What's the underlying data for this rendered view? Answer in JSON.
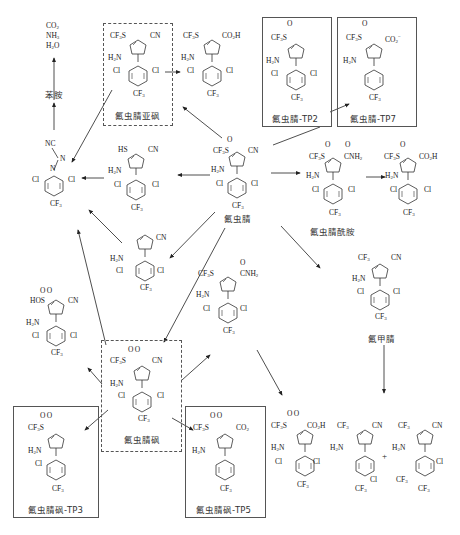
{
  "diagram": {
    "type": "degradation-pathway",
    "end_products": {
      "lines": [
        "CO₂",
        "NH₃",
        "H₂O"
      ],
      "aniline_label": "苯胺"
    },
    "compounds": [
      {
        "id": "fipronil",
        "label": "氟虫腈",
        "substituents": {
          "s4": "CF₃S(=O)",
          "s3": "CN",
          "s5": "H₂N",
          "aryl": "2,6-Cl-4-CF₃-phenyl"
        },
        "frame": "none"
      },
      {
        "id": "fipronil-sulfide",
        "label": "氟虫腈亚砜",
        "substituents": {
          "s4": "CF₃S",
          "s3": "CN",
          "s5": "H₂N",
          "aryl": "2,6-Cl-4-CF₃-phenyl"
        },
        "frame": "dashed"
      },
      {
        "id": "sulfide-acid",
        "label": "",
        "substituents": {
          "s4": "CF₃S",
          "s3": "CO₂H",
          "s5": "H₂N"
        },
        "frame": "none"
      },
      {
        "id": "fipronil-TP2",
        "label": "氟虫腈-TP2",
        "substituents": {
          "s4": "CF₃S(=O)",
          "s3": "",
          "s5": "H₂N"
        },
        "frame": "solid"
      },
      {
        "id": "fipronil-TP7",
        "label": "氟虫腈-TP7",
        "substituents": {
          "s4": "CF₃S(=O)",
          "s3": "CO₂⁻",
          "s5": "H₂N",
          "aryl": "4-CF₃-phenyl"
        },
        "frame": "solid"
      },
      {
        "id": "fipronil-amide",
        "label": "氟虫腈酰胺",
        "substituents": {
          "s4": "CF₃S(=O)",
          "s3": "C(=O)NH₂",
          "s5": "H₂N"
        },
        "frame": "none"
      },
      {
        "id": "amide-acid",
        "label": "",
        "substituents": {
          "s4": "CF₃S(=O)",
          "s3": "CO₂H",
          "s5": "H₂N"
        },
        "frame": "none"
      },
      {
        "id": "thiol",
        "label": "",
        "substituents": {
          "s4": "HS",
          "s3": "CN",
          "s5": "H₂N"
        },
        "frame": "none"
      },
      {
        "id": "desthio",
        "label": "",
        "substituents": {
          "s4": "",
          "s3": "CN",
          "s5": "H₂N"
        },
        "frame": "none"
      },
      {
        "id": "diazo-aryl",
        "label": "",
        "substituents": {
          "top": "NC",
          "link": "N=N",
          "aryl": "2,6-Cl-4-CF₃-phenyl"
        },
        "frame": "none"
      },
      {
        "id": "desulfinyl",
        "label": "氟甲腈",
        "substituents": {
          "s4": "CF₃",
          "s3": "CN",
          "s5": "H₂N"
        },
        "frame": "none"
      },
      {
        "id": "sulfonic-acid",
        "label": "",
        "substituents": {
          "s4": "HOS(=O)₂",
          "s3": "CN",
          "s5": "H₂N"
        },
        "frame": "none"
      },
      {
        "id": "sulfone",
        "label": "氟虫腈砜",
        "substituents": {
          "s4": "CF₃S(=O)₂",
          "s3": "CN",
          "s5": "H₂N"
        },
        "frame": "dashed"
      },
      {
        "id": "sulfone-amide",
        "label": "",
        "substituents": {
          "s4": "CF₃S(=O)₂",
          "s3": "C(=O)NH₂",
          "s5": "H₂N"
        },
        "frame": "none"
      },
      {
        "id": "sulfone-acid",
        "label": "",
        "substituents": {
          "s4": "CF₃S(=O)₂",
          "s3": "CO₂H",
          "s5": "H₂N"
        },
        "frame": "none"
      },
      {
        "id": "fipronil-sulfone-TP3",
        "label": "氟虫腈砜-TP3",
        "substituents": {
          "s4": "CF₃S(=O)₂",
          "s3": "",
          "s5": "H₂N",
          "aryl": "2-Cl-4-CF₃-phenyl"
        },
        "frame": "solid"
      },
      {
        "id": "fipronil-sulfone-TP5",
        "label": "氟虫腈砜-TP5",
        "substituents": {
          "s4": "CF₃S(=O)₂",
          "s3": "CO₂⁻",
          "s5": "H₂N",
          "aryl": "4-CF₃-phenyl"
        },
        "frame": "solid"
      },
      {
        "id": "desulfinyl-dechloro-a",
        "label": "",
        "substituents": {
          "s4": "CF₃",
          "s3": "CN",
          "s5": "H₂N",
          "aryl": "Cl, CF₃-phenyl"
        },
        "frame": "none"
      },
      {
        "id": "desulfinyl-dechloro-b",
        "label": "",
        "substituents": {
          "s4": "CF₃",
          "s3": "CN",
          "s5": "H₂N",
          "aryl": "Cl, CF₃, CF₃-phenyl"
        },
        "frame": "none"
      }
    ],
    "plus_sign": "+",
    "arrows": [
      [
        "fipronil",
        "sulfide-acid"
      ],
      [
        "fipronil",
        "fipronil-TP2"
      ],
      [
        "fipronil",
        "fipronil-amide"
      ],
      [
        "fipronil",
        "thiol"
      ],
      [
        "fipronil",
        "desthio"
      ],
      [
        "fipronil",
        "sulfone"
      ],
      [
        "fipronil",
        "desulfinyl"
      ],
      [
        "fipronil",
        "sulfone-amide"
      ],
      [
        "fipronil-sulfide",
        "sulfide-acid"
      ],
      [
        "fipronil-sulfide",
        "diazo-aryl"
      ],
      [
        "fipronil-TP2",
        "fipronil-TP7"
      ],
      [
        "fipronil-amide",
        "amide-acid"
      ],
      [
        "thiol",
        "diazo-aryl"
      ],
      [
        "desthio",
        "diazo-aryl"
      ],
      [
        "diazo-aryl",
        "aniline"
      ],
      [
        "aniline",
        "end_products"
      ],
      [
        "sulfone",
        "diazo-aryl"
      ],
      [
        "sulfone",
        "sulfonic-acid"
      ],
      [
        "sulfone",
        "sulfone-amide"
      ],
      [
        "sulfone",
        "fipronil-sulfone-TP3"
      ],
      [
        "sulfone",
        "fipronil-sulfone-TP5"
      ],
      [
        "sulfone-amide",
        "sulfone-acid"
      ],
      [
        "desulfinyl",
        "desulfinyl-dechloro"
      ]
    ]
  },
  "text": {
    "co2": "CO",
    "nh3": "NH",
    "h2o": "H",
    "aniline": "苯胺",
    "nc": "NC",
    "n": "N",
    "cl": "Cl",
    "cf3": "CF",
    "cn": "CN",
    "h2n": "H",
    "hs": "HS",
    "cf3s": "CF",
    "co2h": "CO",
    "o": "O",
    "plus": "+",
    "label_fipronil": "氟虫腈",
    "label_sulfide": "氟虫腈亚砜",
    "label_tp2": "氟虫腈-TP2",
    "label_tp7": "氟虫腈-TP7",
    "label_amide": "氟虫腈酰胺",
    "label_desulfinyl": "氟甲腈",
    "label_sulfone": "氟虫腈砜",
    "label_tp3": "氟虫腈砜-TP3",
    "label_tp5": "氟虫腈砜-TP5"
  }
}
